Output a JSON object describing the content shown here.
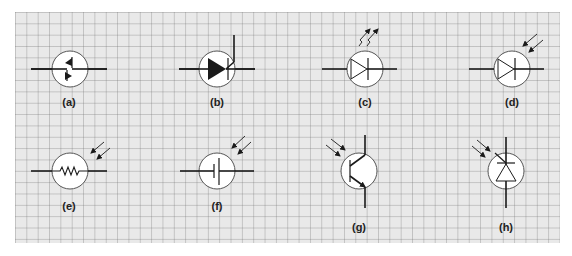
{
  "figure": {
    "background": "#e9e9e9",
    "line_color": "#1a1a1a",
    "circle_fill": "#ffffff",
    "symbols": [
      {
        "id": "a",
        "label": "(a)",
        "name": "diac / bidirectional trigger diode",
        "icon": "bidirectional-diode-icon"
      },
      {
        "id": "b",
        "label": "(b)",
        "name": "thyristor / SCR with gate",
        "icon": "thyristor-icon"
      },
      {
        "id": "c",
        "label": "(c)",
        "name": "light-emitting diode (LED)",
        "icon": "led-icon"
      },
      {
        "id": "d",
        "label": "(d)",
        "name": "photodiode",
        "icon": "photodiode-icon"
      },
      {
        "id": "e",
        "label": "(e)",
        "name": "light-dependent resistor (photoresistor)",
        "icon": "photoresistor-icon"
      },
      {
        "id": "f",
        "label": "(f)",
        "name": "photovoltaic cell",
        "icon": "photocell-icon"
      },
      {
        "id": "g",
        "label": "(g)",
        "name": "phototransistor",
        "icon": "phototransistor-icon"
      },
      {
        "id": "h",
        "label": "(h)",
        "name": "photo-zener / light-activated diode",
        "icon": "light-activated-diode-icon"
      }
    ]
  }
}
